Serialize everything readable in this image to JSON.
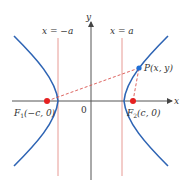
{
  "diagram": {
    "type": "hyperbola-foci",
    "axes": {
      "x_label": "x",
      "y_label": "y",
      "origin_label": "0"
    },
    "directrix_labels": {
      "left": "x = −a",
      "right": "x = a"
    },
    "points": {
      "P": {
        "label": "P(x, y)"
      },
      "F1": {
        "name": "F",
        "sub": "1",
        "coords": "(−c, 0)"
      },
      "F2": {
        "name": "F",
        "sub": "2",
        "coords": "(c, 0)"
      }
    },
    "colors": {
      "curve": "#2e64b4",
      "vertical_lines": "#e0857f",
      "focus": "#e52020",
      "point": "#1f6fd6",
      "dashed": "#d9534f",
      "axis": "#555555"
    }
  }
}
